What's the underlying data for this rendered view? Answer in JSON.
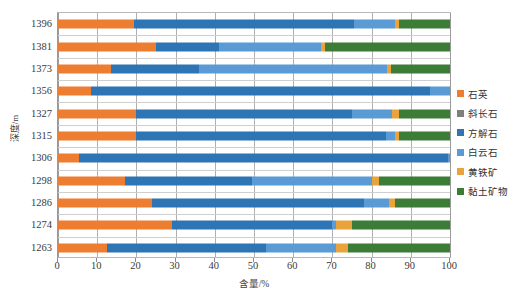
{
  "chart_data": {
    "type": "bar",
    "orientation": "horizontal",
    "stacked": true,
    "title": "",
    "xlabel": "含量/%",
    "ylabel": "深度/m",
    "xlim": [
      0,
      100
    ],
    "xticks": [
      0,
      10,
      20,
      30,
      40,
      50,
      60,
      70,
      80,
      90,
      100
    ],
    "grid": "vertical",
    "legend_position": "right",
    "categories": [
      "1263",
      "1274",
      "1286",
      "1298",
      "1306",
      "1315",
      "1327",
      "1356",
      "1373",
      "1381",
      "1396"
    ],
    "series": [
      {
        "name": "石英",
        "color": "#ed7d31",
        "values": [
          12.4,
          29.0,
          24.0,
          17.0,
          5.3,
          20.0,
          20.0,
          8.5,
          13.5,
          25.0,
          19.5
        ]
      },
      {
        "name": "斜长石",
        "color": "#7f7f7f",
        "values": [
          0,
          0,
          0,
          0,
          0,
          0,
          0,
          0,
          0,
          0,
          0
        ]
      },
      {
        "name": "方解石",
        "color": "#2e75b6",
        "values": [
          40.6,
          41.0,
          54.0,
          32.5,
          94.2,
          63.8,
          55.0,
          86.5,
          22.5,
          16.0,
          56.1
        ]
      },
      {
        "name": "白云石",
        "color": "#5b9bd5",
        "values": [
          18.0,
          1.0,
          6.5,
          30.5,
          0.5,
          2.2,
          10.3,
          5.0,
          48.0,
          26.0,
          10.4
        ]
      },
      {
        "name": "黄铁矿",
        "color": "#e8a33d",
        "values": [
          3.0,
          4.0,
          1.5,
          2.0,
          0.0,
          1.0,
          1.7,
          0.0,
          1.0,
          1.0,
          1.0
        ]
      },
      {
        "name": "黏土矿物",
        "color": "#3d7c36",
        "values": [
          26.0,
          25.0,
          14.0,
          18.0,
          0.0,
          13.0,
          13.0,
          0.0,
          15.0,
          32.0,
          13.0
        ]
      }
    ]
  },
  "axes": {
    "y_title": "深度/m",
    "x_title": "含量/%",
    "y_tick_labels": [
      "1396",
      "1381",
      "1373",
      "1356",
      "1327",
      "1315",
      "1306",
      "1298",
      "1286",
      "1274",
      "1263"
    ],
    "x_tick_labels": [
      "0",
      "10",
      "20",
      "30",
      "40",
      "50",
      "60",
      "70",
      "80",
      "90",
      "100"
    ]
  },
  "legend": {
    "items": [
      {
        "label": "石英",
        "color": "#ed7d31"
      },
      {
        "label": "斜长石",
        "color": "#7f7f7f"
      },
      {
        "label": "方解石",
        "color": "#2e75b6"
      },
      {
        "label": "白云石",
        "color": "#5b9bd5"
      },
      {
        "label": "黄铁矿",
        "color": "#e8a33d"
      },
      {
        "label": "黏土矿物",
        "color": "#3d7c36"
      }
    ]
  }
}
